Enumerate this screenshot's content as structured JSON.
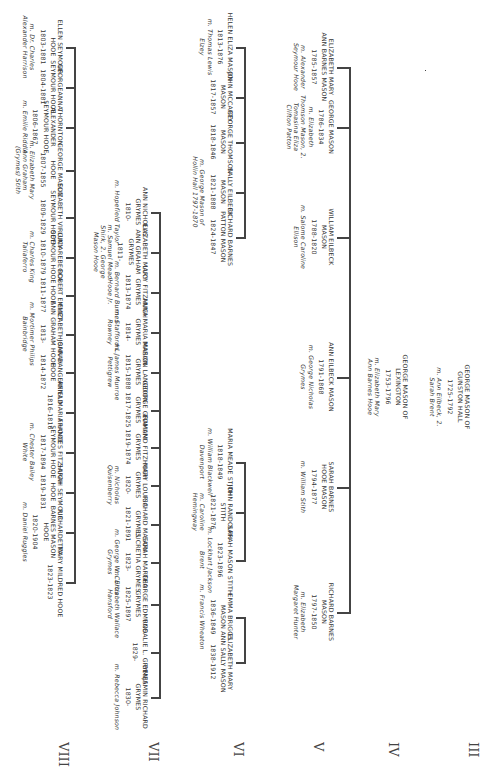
{
  "chart_title": "Mason family descendant chart",
  "generations": [
    "III",
    "IV",
    "V",
    "VI",
    "VII",
    "VIII"
  ],
  "root": {
    "name": "George Mason of Gunston Hall",
    "dates": "1725-1792",
    "spouse": "m. Ann Eilbeck, 2. Sarah Brent"
  },
  "gen4": {
    "name": "George Mason of Lexington",
    "dates": "1753-1796",
    "spouse": "m. Elizabeth Mary Ann Barnes Hooe"
  },
  "gen5": [
    {
      "name": "Elizabeth Mary Ann Barnes Mason",
      "dates": "1785-1857",
      "spouse": "m. Alexander Seymour Hooe"
    },
    {
      "name": "George Mason",
      "dates": "1786-1834",
      "spouse": "m. Elizabeth Thomson Mason, 2. Tomasina Eliza Clifton Patton"
    },
    {
      "name": "William Eilbeck Mason",
      "dates": "1788-1820",
      "spouse": "m. Salome Caroline Ellison"
    },
    {
      "name": "Ann Eilbeck Mason",
      "dates": "1791-1868",
      "spouse": "m. George Nicholas Grymes"
    },
    {
      "name": "Sarah Barnes Hooe Mason",
      "dates": "1794-1877",
      "spouse": "m. William Stith"
    },
    {
      "name": "Richard Barnes Mason",
      "dates": "1797-1850",
      "spouse": "m. Elizabeth Margaret Hunter"
    }
  ],
  "gen6_george": [
    {
      "name": "Helen Eliza Mason",
      "dates": "1813-1876",
      "spouse": "m. Thomas Lewis Elzey"
    },
    {
      "name": "John McCarty Mason",
      "dates": "1817-1857",
      "spouse": ""
    },
    {
      "name": "George Thomson Mason",
      "dates": "1818-1846",
      "spouse": ""
    },
    {
      "name": "Sally Eilbeck Mason",
      "dates": "1821-1888",
      "spouse": "m. George Mason of Hollin Hall 1797-1870"
    },
    {
      "name": "Richard Barnes Patton Mason",
      "dates": "1824-1847",
      "spouse": ""
    }
  ],
  "gen6_stith": [
    {
      "name": "Maria Meade Stith",
      "dates": "1818-1849",
      "spouse": "m. William Blackwell Davenport"
    },
    {
      "name": "John Randolph Stith",
      "dates": "1821-1876",
      "spouse": "m. Caroline Hemingway"
    },
    {
      "name": "Sarah Mason Stith",
      "dates": "1823-1896",
      "spouse": "m. Lockhart Jackson Brent"
    }
  ],
  "gen6_rbmason": [
    {
      "name": "Emma Briggs Mason",
      "dates": "1836-1849",
      "spouse": "m. Francis Wheaton"
    },
    {
      "name": "Elizabeth Mary Ann Sally Mason",
      "dates": "1838-1912",
      "spouse": ""
    }
  ],
  "gen6_grymes": [
    {
      "name": "Ann Nicholas Grymes",
      "dates": "1810-",
      "spouse": "m. Hopefield Taylor"
    },
    {
      "name": "Elizabeth Mary Ann Graham Grymes",
      "dates": "1811-",
      "spouse": "m. Samuel Mead Shirk, 2. George Mason Hooe"
    },
    {
      "name": "Lucy Fitzhugh Grymes",
      "dates": "1813-1874",
      "spouse": "m. Bernard Burnes Hooe Jr."
    },
    {
      "name": "Anna Maria Mason Grymes",
      "dates": "1814-",
      "spouse": "m. Stafford L. Rowney"
    },
    {
      "name": "Marion Langdon Grymes",
      "dates": "1815-1888",
      "spouse": "m. James Munroe Pettigrew"
    },
    {
      "name": "George Graham Grymes",
      "dates": "1817-1825",
      "spouse": ""
    },
    {
      "name": "Edmund Fitzhugh Grymes",
      "dates": "1819-1874",
      "spouse": ""
    },
    {
      "name": "Mary Louisa Grymes",
      "dates": "1820-",
      "spouse": "m. Nicholas Quisenberry"
    },
    {
      "name": "Richard Mason Grymes",
      "dates": "1821-1891",
      "spouse": ""
    },
    {
      "name": "Sarah Martha Lucretia Grymes",
      "dates": "1823-",
      "spouse": "m. George W. Curtis Grymes"
    },
    {
      "name": "George Edmund Grymes",
      "dates": "1825-1897",
      "spouse": "m. Elizabeth Wallace Hansford"
    },
    {
      "name": "Rosalie L. Grymes",
      "dates": "1829-",
      "spouse": ""
    },
    {
      "name": "Benjamin Richard Grymes",
      "dates": "1830-",
      "spouse": "m. Rebecca Johnson"
    }
  ],
  "gen6_hooe": [
    {
      "name": "Ellen Seymour Hooe",
      "dates": "1803-1881",
      "spouse": "m. Dr. Charles Alexander Harrison"
    },
    {
      "name": "Georgeanna Seymour Hooe",
      "dates": "1804-1881",
      "spouse": ""
    },
    {
      "name": "Thornton Alexander Seymour Hooe",
      "dates": "1806-1867",
      "spouse": "m. Emilie Riddle"
    },
    {
      "name": "George Mason Hooe",
      "dates": "1807-1855",
      "spouse": "m. Elizabeth Mary Ann Graham (Grymes) Stith"
    },
    {
      "name": "Elizabeth Virginia Seymour Hooe",
      "dates": "1809-1829",
      "spouse": ""
    },
    {
      "name": "Lucy Rebecca Seymour Hooe",
      "dates": "1810-1879",
      "spouse": "m. Charles King Taliaferro"
    },
    {
      "name": "Robert Emmet Hooe",
      "dates": "1811-1877",
      "spouse": ""
    },
    {
      "name": "Elizabeth Sarah Ann Graham Hooe",
      "dates": "1813-",
      "spouse": "m. Mortimer Philips Bainbridge"
    },
    {
      "name": "John Dangerfield Hooe",
      "dates": "1814-1872",
      "spouse": ""
    },
    {
      "name": "Anna Maria Hooe",
      "dates": "1816-1816",
      "spouse": ""
    },
    {
      "name": "Frances Fitzhugh Seymour Hooe",
      "dates": "1817-1894",
      "spouse": "m. Chester Bailey White"
    },
    {
      "name": "Sarah Seymour Hooe",
      "dates": "1819-1831",
      "spouse": ""
    },
    {
      "name": "Richardetta Barnes Mason Hooe",
      "dates": "1820-1904",
      "spouse": "m. Daniel Ruggles"
    },
    {
      "name": "Mary Mildred Hooe",
      "dates": "1823-1823",
      "spouse": ""
    }
  ]
}
